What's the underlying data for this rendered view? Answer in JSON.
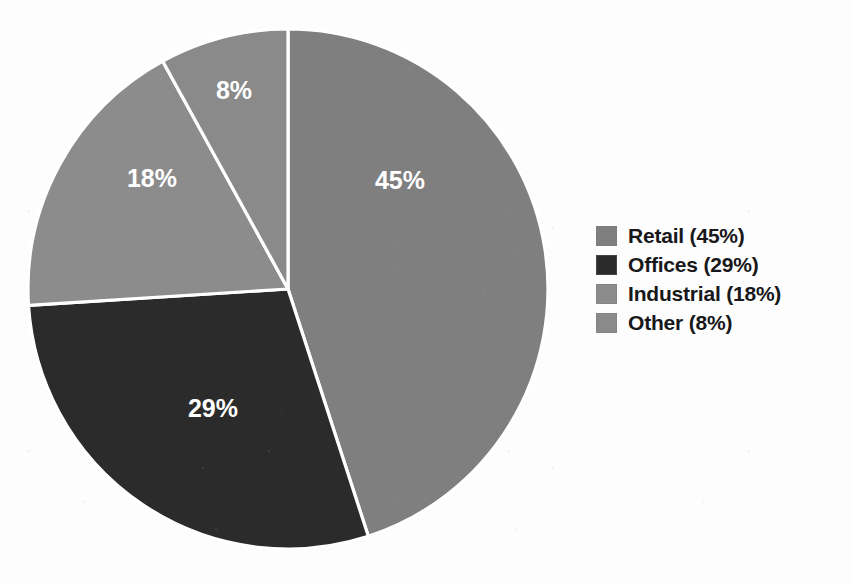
{
  "chart_data": {
    "type": "pie",
    "title": "",
    "subtitle": "",
    "xlabel": "",
    "ylabel": "",
    "grid": false,
    "legend_position": "right",
    "start_angle_deg": 0,
    "direction": "clockwise",
    "categories": [
      "Retail",
      "Offices",
      "Industrial",
      "Other"
    ],
    "values": [
      45,
      29,
      18,
      8
    ],
    "value_unit": "%",
    "slice_labels": [
      "45%",
      "29%",
      "18%",
      "8%"
    ],
    "slice_label_color": "#ffffff",
    "separator_color": "#ffffff",
    "colors": [
      "#7f7f7f",
      "#2b2b2b",
      "#8c8c8c",
      "#8a8a8a"
    ],
    "legend_entries": [
      {
        "label": "Retail (45%)",
        "color": "#7f7f7f",
        "value": 45
      },
      {
        "label": "Offices (29%)",
        "color": "#2b2b2b",
        "value": 29
      },
      {
        "label": "Industrial (18%)",
        "color": "#8c8c8c",
        "value": 18
      },
      {
        "label": "Other (8%)",
        "color": "#8a8a8a",
        "value": 8
      }
    ]
  },
  "canvas": {
    "background": "#fdfdfd",
    "width": 850,
    "height": 584
  },
  "pie": {
    "center_x": 288,
    "center_y": 289,
    "radius": 260,
    "slices": [
      {
        "name": "retail",
        "label": "45%",
        "value": 45,
        "color": "#7f7f7f",
        "label_x": 400,
        "label_y": 182
      },
      {
        "name": "offices",
        "label": "29%",
        "value": 29,
        "color": "#2b2b2b",
        "label_x": 213,
        "label_y": 410
      },
      {
        "name": "industrial",
        "label": "18%",
        "value": 18,
        "color": "#8c8c8c",
        "label_x": 152,
        "label_y": 180
      },
      {
        "name": "other",
        "label": "8%",
        "value": 8,
        "color": "#8a8a8a",
        "label_x": 234,
        "label_y": 92
      }
    ]
  }
}
